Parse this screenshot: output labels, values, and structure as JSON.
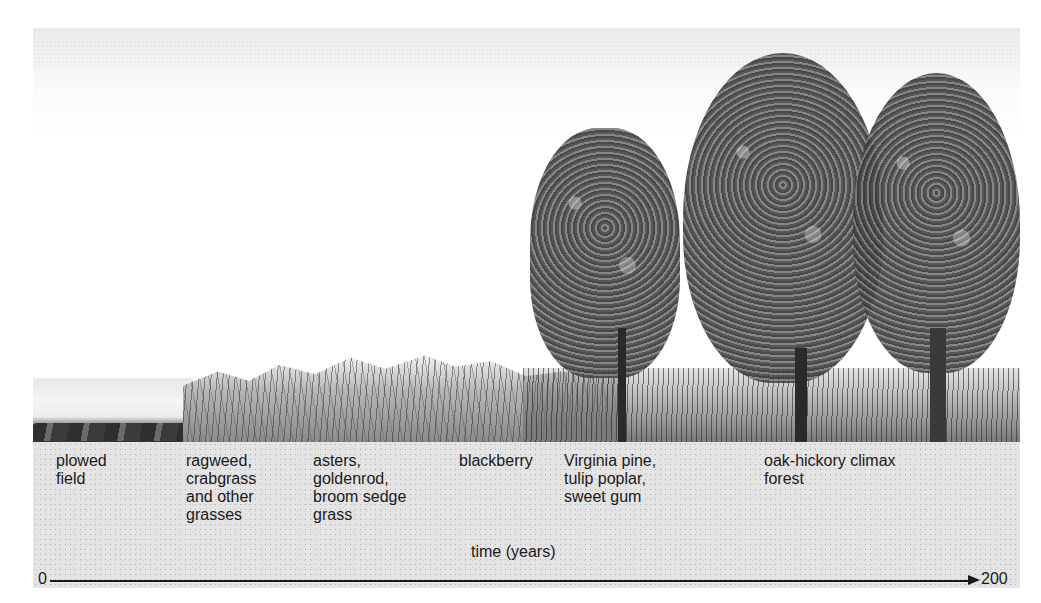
{
  "diagram": {
    "type": "ecological succession timeline",
    "stages": [
      {
        "label": "plowed field",
        "lines": "plowed\nfield"
      },
      {
        "label": "ragweed, crabgrass and other grasses",
        "lines": "ragweed,\ncrabgrass\nand other\ngrasses"
      },
      {
        "label": "asters, goldenrod, broom sedge grass",
        "lines": "asters,\ngoldenrod,\nbroom sedge\ngrass"
      },
      {
        "label": "blackberry",
        "lines": "blackberry"
      },
      {
        "label": "Virginia pine, tulip poplar, sweet gum",
        "lines": "Virginia pine,\ntulip poplar,\nsweet gum"
      },
      {
        "label": "oak-hickory climax forest",
        "lines": "oak-hickory climax\nforest"
      }
    ],
    "axis": {
      "title": "time (years)",
      "start": "0",
      "end": "200"
    }
  }
}
